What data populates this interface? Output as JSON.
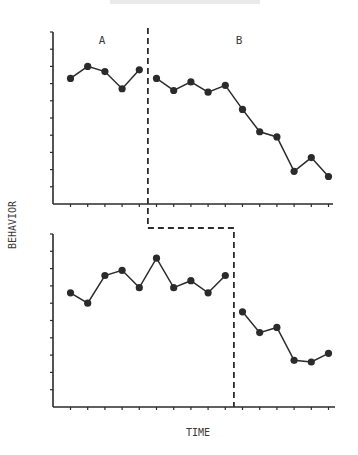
{
  "chart_data": {
    "type": "line",
    "title": "",
    "xlabel": "TIME",
    "ylabel": "BEHAVIOR",
    "grid": false,
    "legend": null,
    "phase_labels": [
      "A",
      "B"
    ],
    "panels": [
      {
        "name": "top",
        "ylim": [
          0,
          10
        ],
        "phase_change_after_session": 5,
        "x": [
          1,
          2,
          3,
          4,
          5,
          6,
          7,
          8,
          9,
          10,
          11,
          12,
          13,
          14,
          15,
          16
        ],
        "series": [
          {
            "name": "A",
            "x": [
              1,
              2,
              3,
              4,
              5
            ],
            "values": [
              7.3,
              8.0,
              7.7,
              6.7,
              7.8
            ]
          },
          {
            "name": "B",
            "x": [
              6,
              7,
              8,
              9,
              10,
              11,
              12,
              13,
              14,
              15,
              16
            ],
            "values": [
              7.3,
              6.6,
              7.1,
              6.5,
              6.9,
              5.5,
              4.2,
              3.9,
              1.9,
              2.7,
              1.6
            ]
          }
        ]
      },
      {
        "name": "bottom",
        "ylim": [
          0,
          10
        ],
        "phase_change_after_session": 10,
        "x": [
          1,
          2,
          3,
          4,
          5,
          6,
          7,
          8,
          9,
          10,
          11,
          12,
          13,
          14,
          15,
          16
        ],
        "series": [
          {
            "name": "A",
            "x": [
              1,
              2,
              3,
              4,
              5,
              6,
              7,
              8,
              9,
              10
            ],
            "values": [
              6.6,
              6.0,
              7.6,
              7.9,
              6.9,
              8.6,
              6.9,
              7.3,
              6.6,
              7.6
            ]
          },
          {
            "name": "B",
            "x": [
              11,
              12,
              13,
              14,
              15,
              16
            ],
            "values": [
              5.5,
              4.3,
              4.6,
              2.7,
              2.6,
              3.1
            ]
          }
        ]
      }
    ],
    "annotations": [
      "Multiple-baseline design: staggered dashed phase-change line"
    ]
  },
  "labels": {
    "phase_a": "A",
    "phase_b": "B",
    "y_axis": "BEHAVIOR",
    "x_axis": "TIME"
  },
  "colors": {
    "ink": "#2b2b2b",
    "background": "#ffffff"
  }
}
